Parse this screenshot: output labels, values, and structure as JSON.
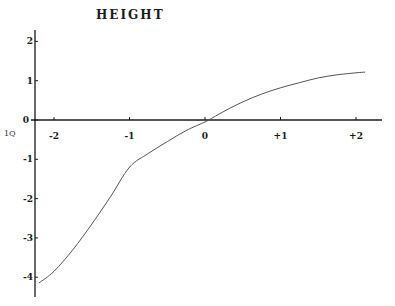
{
  "chart_data": {
    "type": "line",
    "title": "HEIGHT",
    "xlabel": "",
    "ylabel": "",
    "side_label": "1Q",
    "xlim": [
      -2.25,
      2.35
    ],
    "ylim": [
      -4.4,
      2.1
    ],
    "grid": false,
    "x_ticks": [
      -2,
      -1,
      0,
      1,
      2
    ],
    "x_tick_labels": [
      "-2",
      "-1",
      "0",
      "+1",
      "+2"
    ],
    "y_ticks": [
      2,
      1,
      0,
      -1,
      -2,
      -3,
      -4
    ],
    "y_tick_labels": [
      "2",
      "1",
      "0",
      "-1",
      "-2",
      "-3",
      "-4"
    ],
    "series": [
      {
        "name": "height",
        "color": "#555555",
        "x": [
          -2.2,
          -2.0,
          -1.75,
          -1.5,
          -1.25,
          -1.0,
          -0.75,
          -0.5,
          -0.25,
          0.0,
          0.05,
          0.25,
          0.5,
          0.75,
          1.0,
          1.25,
          1.5,
          1.75,
          2.0,
          2.12
        ],
        "y": [
          -4.15,
          -3.85,
          -3.3,
          -2.65,
          -1.95,
          -1.2,
          -0.85,
          -0.55,
          -0.27,
          -0.05,
          0.0,
          0.22,
          0.46,
          0.66,
          0.82,
          0.95,
          1.07,
          1.15,
          1.2,
          1.22
        ]
      }
    ]
  },
  "colors": {
    "axis": "#1a1a1a",
    "curve": "#666666",
    "text": "#1a1a1a"
  }
}
